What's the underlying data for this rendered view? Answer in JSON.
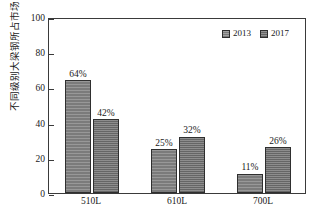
{
  "chart_data": {
    "type": "bar",
    "title": "",
    "xlabel": "",
    "ylabel": "不同级别大梁钢所占市场比例/%",
    "categories": [
      "510L",
      "610L",
      "700L"
    ],
    "ylim": [
      0,
      100
    ],
    "yticks": [
      0,
      20,
      40,
      60,
      80,
      100
    ],
    "ytick_labels": [
      "0",
      "20",
      "40",
      "60",
      "80",
      "100"
    ],
    "grid": false,
    "legend_position": "top-right",
    "series": [
      {
        "name": "2013",
        "color": "#7b7b7b",
        "values": [
          64,
          25,
          11
        ],
        "data_labels": [
          "64%",
          "25%",
          "11%"
        ]
      },
      {
        "name": "2017",
        "color": "#666666",
        "values": [
          42,
          32,
          26
        ],
        "data_labels": [
          "42%",
          "32%",
          "26%"
        ]
      }
    ]
  },
  "axis": {
    "frame_color": "#3a3a3a",
    "text_color": "#1a1a1a"
  }
}
